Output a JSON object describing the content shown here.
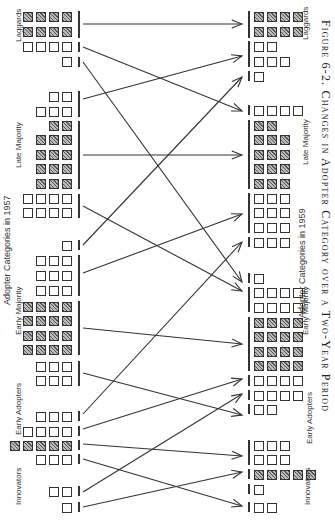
{
  "figure": {
    "caption": "Figure 6-2. Changes in Adopter Category over a Two-Year Period",
    "left_axis_title": "Adopter Categories in 1957",
    "right_axis_title": "Adopter Categories in 1959",
    "left_categories": [
      {
        "label": "Laggards",
        "y": 42
      },
      {
        "label": "Late Majority",
        "y": 168
      },
      {
        "label": "Early Majority",
        "y": 335
      },
      {
        "label": "Early Adopters",
        "y": 435
      },
      {
        "label": "Innovators",
        "y": 505
      }
    ],
    "right_categories": [
      {
        "label": "Laggards",
        "y": 40
      },
      {
        "label": "Late Majority",
        "y": 165
      },
      {
        "label": "Early Majority",
        "y": 335
      },
      {
        "label": "Early Adopters",
        "y": 444
      },
      {
        "label": "Innovators",
        "y": 505
      }
    ]
  },
  "chart_data": {
    "type": "diagram",
    "title": "Changes in Adopter Category over a Two-Year Period",
    "from_label": "Adopter Categories in 1957",
    "to_label": "Adopter Categories in 1959",
    "legend": {
      "hatched_box": "farmer remaining in same category",
      "empty_box": "farmer changing category"
    },
    "left_groups": [
      {
        "y": 12,
        "n": 4,
        "h": true
      },
      {
        "y": 27,
        "n": 4,
        "h": true
      },
      {
        "y": 42,
        "n": 4,
        "h": false
      },
      {
        "y": 57,
        "n": 1,
        "h": false
      },
      {
        "y": 92,
        "n": 2,
        "h": false
      },
      {
        "y": 107,
        "n": 3,
        "h": false
      },
      {
        "y": 121,
        "n": 2,
        "h": true
      },
      {
        "y": 135,
        "n": 3,
        "h": true
      },
      {
        "y": 150,
        "n": 3,
        "h": true
      },
      {
        "y": 164,
        "n": 3,
        "h": true
      },
      {
        "y": 179,
        "n": 3,
        "h": true
      },
      {
        "y": 194,
        "n": 4,
        "h": false
      },
      {
        "y": 208,
        "n": 4,
        "h": false
      },
      {
        "y": 241,
        "n": 1,
        "h": false
      },
      {
        "y": 256,
        "n": 3,
        "h": false
      },
      {
        "y": 271,
        "n": 3,
        "h": false
      },
      {
        "y": 286,
        "n": 3,
        "h": false
      },
      {
        "y": 302,
        "n": 4,
        "h": true
      },
      {
        "y": 316,
        "n": 4,
        "h": true
      },
      {
        "y": 331,
        "n": 4,
        "h": true
      },
      {
        "y": 345,
        "n": 4,
        "h": true
      },
      {
        "y": 362,
        "n": 3,
        "h": false
      },
      {
        "y": 376,
        "n": 3,
        "h": false
      },
      {
        "y": 412,
        "n": 3,
        "h": false
      },
      {
        "y": 427,
        "n": 4,
        "h": false
      },
      {
        "y": 441,
        "n": 5,
        "h": true
      },
      {
        "y": 455,
        "n": 3,
        "h": false
      },
      {
        "y": 487,
        "n": 2,
        "h": false
      },
      {
        "y": 503,
        "n": 1,
        "h": false
      }
    ],
    "left_bars": [
      {
        "y1": 11,
        "y2": 38
      },
      {
        "y1": 42,
        "y2": 52
      },
      {
        "y1": 57,
        "y2": 67
      },
      {
        "y1": 91,
        "y2": 117
      },
      {
        "y1": 121,
        "y2": 189
      },
      {
        "y1": 194,
        "y2": 218
      },
      {
        "y1": 240,
        "y2": 250
      },
      {
        "y1": 255,
        "y2": 296
      },
      {
        "y1": 301,
        "y2": 355
      },
      {
        "y1": 361,
        "y2": 386
      },
      {
        "y1": 411,
        "y2": 421
      },
      {
        "y1": 426,
        "y2": 436
      },
      {
        "y1": 440,
        "y2": 450
      },
      {
        "y1": 454,
        "y2": 464
      },
      {
        "y1": 486,
        "y2": 496
      },
      {
        "y1": 502,
        "y2": 512
      }
    ],
    "right_groups": [
      {
        "y": 12,
        "n": 4,
        "h": true
      },
      {
        "y": 27,
        "n": 4,
        "h": true
      },
      {
        "y": 42,
        "n": 2,
        "h": false
      },
      {
        "y": 57,
        "n": 3,
        "h": false
      },
      {
        "y": 72,
        "n": 1,
        "h": false
      },
      {
        "y": 106,
        "n": 4,
        "h": false
      },
      {
        "y": 121,
        "n": 2,
        "h": true
      },
      {
        "y": 135,
        "n": 3,
        "h": true
      },
      {
        "y": 150,
        "n": 3,
        "h": true
      },
      {
        "y": 164,
        "n": 3,
        "h": true
      },
      {
        "y": 179,
        "n": 3,
        "h": true
      },
      {
        "y": 194,
        "n": 3,
        "h": false
      },
      {
        "y": 208,
        "n": 3,
        "h": false
      },
      {
        "y": 223,
        "n": 3,
        "h": false
      },
      {
        "y": 238,
        "n": 3,
        "h": false
      },
      {
        "y": 274,
        "n": 1,
        "h": false
      },
      {
        "y": 288,
        "n": 4,
        "h": false
      },
      {
        "y": 303,
        "n": 4,
        "h": false
      },
      {
        "y": 318,
        "n": 4,
        "h": true
      },
      {
        "y": 332,
        "n": 4,
        "h": true
      },
      {
        "y": 347,
        "n": 4,
        "h": true
      },
      {
        "y": 361,
        "n": 4,
        "h": true
      },
      {
        "y": 376,
        "n": 4,
        "h": false
      },
      {
        "y": 391,
        "n": 4,
        "h": false
      },
      {
        "y": 405,
        "n": 2,
        "h": false
      },
      {
        "y": 441,
        "n": 3,
        "h": false
      },
      {
        "y": 455,
        "n": 3,
        "h": false
      },
      {
        "y": 470,
        "n": 5,
        "h": true
      },
      {
        "y": 485,
        "n": 1,
        "h": false
      },
      {
        "y": 503,
        "n": 2,
        "h": false
      }
    ],
    "right_bars": [
      {
        "y1": 11,
        "y2": 38
      },
      {
        "y1": 41,
        "y2": 67
      },
      {
        "y1": 71,
        "y2": 81
      },
      {
        "y1": 105,
        "y2": 115
      },
      {
        "y1": 120,
        "y2": 189
      },
      {
        "y1": 193,
        "y2": 233
      },
      {
        "y1": 237,
        "y2": 247
      },
      {
        "y1": 273,
        "y2": 283
      },
      {
        "y1": 287,
        "y2": 312
      },
      {
        "y1": 317,
        "y2": 371
      },
      {
        "y1": 375,
        "y2": 386
      },
      {
        "y1": 390,
        "y2": 400
      },
      {
        "y1": 404,
        "y2": 414
      },
      {
        "y1": 440,
        "y2": 465
      },
      {
        "y1": 469,
        "y2": 479
      },
      {
        "y1": 484,
        "y2": 494
      },
      {
        "y1": 502,
        "y2": 512
      }
    ],
    "arrows": [
      {
        "from_y": 24,
        "to_y": 24
      },
      {
        "from_y": 47,
        "to_y": 111
      },
      {
        "from_y": 62,
        "to_y": 282
      },
      {
        "from_y": 99,
        "to_y": 56
      },
      {
        "from_y": 155,
        "to_y": 155
      },
      {
        "from_y": 206,
        "to_y": 291
      },
      {
        "from_y": 245,
        "to_y": 77
      },
      {
        "from_y": 273,
        "to_y": 214
      },
      {
        "from_y": 328,
        "to_y": 344
      },
      {
        "from_y": 373,
        "to_y": 415
      },
      {
        "from_y": 414,
        "to_y": 242
      },
      {
        "from_y": 429,
        "to_y": 379
      },
      {
        "from_y": 444,
        "to_y": 456
      },
      {
        "from_y": 459,
        "to_y": 506
      },
      {
        "from_y": 492,
        "to_y": 394
      },
      {
        "from_y": 507,
        "to_y": 472
      }
    ]
  }
}
